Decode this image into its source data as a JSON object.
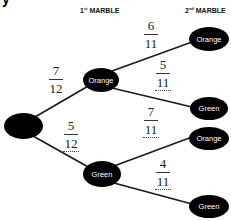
{
  "heading_fragment": "y",
  "headers": {
    "first": {
      "prefix": "1",
      "sup": "st",
      "label": "MARBLE"
    },
    "second": {
      "prefix": "2",
      "sup": "nd",
      "label": "MARBLE"
    }
  },
  "nodes": {
    "root": "",
    "first_orange": "Orange",
    "first_green": "Green",
    "second_oo": "Orange",
    "second_og": "Green",
    "second_go": "Orange",
    "second_gg": "Green"
  },
  "fractions": {
    "p_orange_first": {
      "num": "7",
      "den": "12",
      "dotted": false
    },
    "p_green_first": {
      "num": "5",
      "den": "12",
      "dotted": true
    },
    "p_orange_after_orange": {
      "num": "6",
      "den": "11",
      "dotted": false
    },
    "p_green_after_orange": {
      "num": "5",
      "den": "11",
      "dotted": true
    },
    "p_orange_after_green": {
      "num": "7",
      "den": "11",
      "dotted": true
    },
    "p_green_after_green": {
      "num": "4",
      "den": "11",
      "dotted": true
    }
  },
  "colors": {
    "node_fill": "#000000",
    "node_text": "#ffffff",
    "line": "#1a1a1a"
  }
}
